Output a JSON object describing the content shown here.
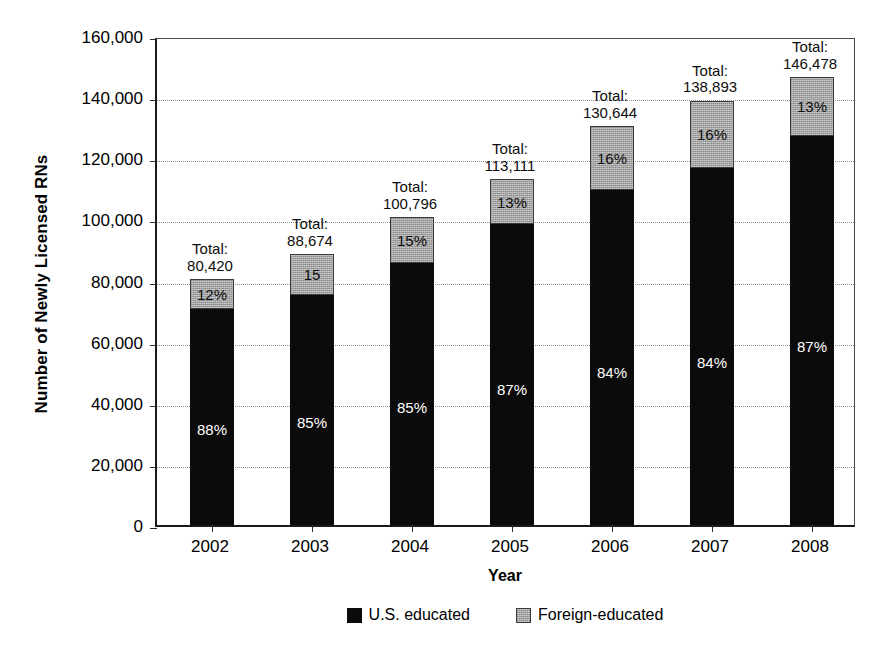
{
  "chart_data": {
    "type": "bar",
    "subtype": "stacked-bar-100-percent-annotated",
    "title": "",
    "xlabel": "Year",
    "ylabel": "Number of Newly Licensed RNs",
    "categories": [
      "2002",
      "2003",
      "2004",
      "2005",
      "2006",
      "2007",
      "2008"
    ],
    "totals": [
      80420,
      88674,
      100796,
      113111,
      130644,
      138893,
      146478
    ],
    "total_labels": [
      "80,420",
      "88,674",
      "100,796",
      "113,111",
      "130,644",
      "138,893",
      "146,478"
    ],
    "total_prefix": "Total:",
    "series": [
      {
        "name": "U.S. educated",
        "color": "#0b0b0b",
        "percent_values": [
          88,
          85,
          85,
          87,
          84,
          84,
          87
        ],
        "percent_labels": [
          "88%",
          "85%",
          "85%",
          "87%",
          "84%",
          "84%",
          "87%"
        ],
        "absolute_values": [
          70770,
          75373,
          85677,
          98407,
          109741,
          116670,
          127436
        ]
      },
      {
        "name": "Foreign-educated",
        "color": "#a2a2a2",
        "percent_values": [
          12,
          15,
          15,
          13,
          16,
          16,
          13
        ],
        "percent_labels": [
          "12%",
          "15",
          "15%",
          "13%",
          "16%",
          "16%",
          "13%"
        ],
        "absolute_values": [
          9650,
          13301,
          15119,
          14704,
          20903,
          22223,
          19042
        ]
      }
    ],
    "ylim": [
      0,
      160000
    ],
    "ytick_values": [
      0,
      20000,
      40000,
      60000,
      80000,
      100000,
      120000,
      140000,
      160000
    ],
    "ytick_labels": [
      "0",
      "20,000",
      "40,000",
      "60,000",
      "80,000",
      "100,000",
      "120,000",
      "140,000",
      "160,000"
    ],
    "grid": true,
    "grid_style": "dotted-horizontal",
    "legend_position": "bottom-center",
    "legend_entries": [
      "U.S. educated",
      "Foreign-educated"
    ]
  },
  "axes": {
    "y_title": "Number of Newly Licensed RNs",
    "x_title": "Year",
    "y_ticks": [
      {
        "label": "160,000",
        "value": 160000
      },
      {
        "label": "140,000",
        "value": 140000
      },
      {
        "label": "120,000",
        "value": 120000
      },
      {
        "label": "100,000",
        "value": 100000
      },
      {
        "label": "80,000",
        "value": 80000
      },
      {
        "label": "60,000",
        "value": 60000
      },
      {
        "label": "40,000",
        "value": 40000
      },
      {
        "label": "20,000",
        "value": 20000
      },
      {
        "label": "0",
        "value": 0
      }
    ],
    "x_ticks": [
      "2002",
      "2003",
      "2004",
      "2005",
      "2006",
      "2007",
      "2008"
    ]
  },
  "bars": [
    {
      "year": "2002",
      "total_word": "Total:",
      "total_value": "80,420",
      "us_label": "88%",
      "foreign_label": "12%"
    },
    {
      "year": "2003",
      "total_word": "Total:",
      "total_value": "88,674",
      "us_label": "85%",
      "foreign_label": "15"
    },
    {
      "year": "2004",
      "total_word": "Total:",
      "total_value": "100,796",
      "us_label": "85%",
      "foreign_label": "15%"
    },
    {
      "year": "2005",
      "total_word": "Total:",
      "total_value": "113,111",
      "us_label": "87%",
      "foreign_label": "13%"
    },
    {
      "year": "2006",
      "total_word": "Total:",
      "total_value": "130,644",
      "us_label": "84%",
      "foreign_label": "16%"
    },
    {
      "year": "2007",
      "total_word": "Total:",
      "total_value": "138,893",
      "us_label": "84%",
      "foreign_label": "16%"
    },
    {
      "year": "2008",
      "total_word": "Total:",
      "total_value": "146,478",
      "us_label": "87%",
      "foreign_label": "13%"
    }
  ],
  "legend": {
    "items": [
      {
        "label": "U.S. educated",
        "color": "#0b0b0b"
      },
      {
        "label": "Foreign-educated",
        "color": "#a2a2a2"
      }
    ]
  }
}
